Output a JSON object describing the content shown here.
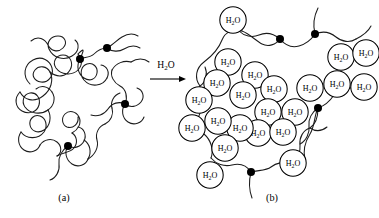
{
  "figure": {
    "background_color": "#ffffff",
    "ink_color": "#000000",
    "width": 379,
    "height": 218
  },
  "reaction": {
    "reagent_main": "H",
    "reagent_sub": "2",
    "reagent_tail": "O",
    "reagent_full": "H2O",
    "arrow_direction": "right"
  },
  "panels": [
    {
      "id": "a",
      "caption": "(a)",
      "state": "dry-collapsed-polymer-network",
      "crosslink_count": 4,
      "water_count": 0
    },
    {
      "id": "b",
      "caption": "(b)",
      "state": "swollen-hydrated-network",
      "crosslink_count": 4,
      "water_count": 22
    }
  ],
  "water_label": {
    "main": "H",
    "sub": "2",
    "tail": "O",
    "full": "H2O"
  },
  "panel_a": {
    "chains": [
      "M 30 84 C 22 76 24 65 33 60 C 42 55 50 61 52 68 C 54 76 48 83 41 82 C 34 81 31 75 35 70 C 39 65 47 66 50 72 C 54 80 51 90 43 96 C 34 103 24 100 20 92",
      "M 31 41 C 38 35 45 39 48 45 C 51 51 58 53 63 48 C 68 43 65 36 58 36 C 51 36 46 42 49 49 C 53 58 64 61 72 56 C 79 52 80 44 75 40",
      "M 50 72 C 57 78 66 77 70 70 C 74 63 70 55 63 55 C 56 55 52 62 56 68 C 61 75 72 76 78 70 C 83 65 82 58 78 54",
      "M 78 54 C 82 50 86 46 80 59",
      "M 80 59 C 84 57 90 58 94 54 C 98 50 103 48 107 48",
      "M 107 48 C 113 45 117 40 122 37 C 127 34 133 33 138 36",
      "M 107 48 C 112 52 119 52 124 49 C 129 46 135 45 140 48",
      "M 80 59 C 76 66 78 74 84 78 C 90 82 96 79 97 73 C 98 67 93 62 87 64 C 81 66 79 74 84 80 C 91 88 103 86 107 78",
      "M 107 78 C 110 72 107 66 101 65",
      "M 20 92 C 14 98 15 107 22 111 C 29 115 37 112 39 105 C 41 98 36 92 30 93 C 24 94 21 101 25 107 C 30 114 41 115 48 110",
      "M 48 110 C 54 106 56 98 52 92",
      "M 52 92 C 48 86 41 85 36 89",
      "M 48 110 C 52 117 50 126 44 130 C 38 134 31 131 30 125 C 29 119 34 114 40 116 C 46 118 48 126 44 132 C 38 140 26 139 21 132",
      "M 21 132 C 17 138 18 146 24 150 C 30 154 38 151 40 145",
      "M 40 145 C 44 139 52 138 57 142 C 62 146 62 153 57 156",
      "M 57 156 C 63 152 70 153 74 148 C 78 143 77 136 72 133",
      "M 72 133 C 78 130 82 123 79 117 C 76 111 69 110 65 114 C 61 118 62 125 67 127 C 73 129 79 124 78 117",
      "M 68 146 C 74 149 81 147 84 141 C 87 135 84 128 78 127",
      "M 68 146 C 64 152 66 160 72 164 C 78 168 86 165 88 159",
      "M 88 159 C 92 152 90 144 84 140",
      "M 68 146 C 62 150 58 157 59 164 C 60 171 56 178 50 180",
      "M 88 159 C 95 155 99 147 97 140 C 95 133 99 126 105 124",
      "M 105 124 C 111 121 114 114 112 108",
      "M 112 108 C 110 102 114 95 120 93",
      "M 125 104 C 130 108 137 107 141 102 C 145 97 143 90 137 88",
      "M 125 104 C 121 110 122 118 128 122 C 134 126 142 123 144 117",
      "M 125 104 C 128 97 126 89 120 86 C 114 83 110 76 112 70",
      "M 112 70 C 116 63 124 60 131 62",
      "M 131 62 C 137 58 144 58 149 62",
      "M 125 104 C 119 101 112 103 108 109 C 104 115 97 117 91 115"
    ],
    "crosslinks": [
      {
        "cx": 80,
        "cy": 59,
        "r": 4.0
      },
      {
        "cx": 107,
        "cy": 48,
        "r": 4.0
      },
      {
        "cx": 125,
        "cy": 104,
        "r": 4.0
      },
      {
        "cx": 68,
        "cy": 146,
        "r": 4.0
      }
    ],
    "caption_x": 64,
    "caption_y": 201
  },
  "panel_b": {
    "chains": [
      "M 200 86 C 194 78 196 68 204 62 C 212 56 219 48 222 40 C 225 32 234 28 242 31",
      "M 242 31 C 250 34 256 41 262 44 C 268 47 276 45 280 39",
      "M 280 39 C 285 45 292 48 299 46 C 306 44 311 40 315 34",
      "M 200 86 C 194 94 195 104 202 110",
      "M 202 110 C 196 118 197 128 204 134 C 211 140 214 150 211 158",
      "M 211 158 C 216 164 224 167 232 165 C 240 163 247 166 251 172",
      "M 251 172 C 258 170 266 171 271 167 C 276 163 284 161 290 164",
      "M 290 164 C 297 160 301 152 300 145 C 299 138 303 130 310 128",
      "M 310 128 C 316 124 318 117 318 108",
      "M 318 108 C 324 106 330 101 334 95 C 338 89 345 86 351 88",
      "M 318 108 C 312 112 308 119 309 126 C 310 133 306 141 300 144",
      "M 318 108 C 314 116 315 126 310 134 C 305 142 303 151 305 159",
      "M 315 34 C 313 26 314 16 318 8",
      "M 315 34 C 322 31 330 32 336 37 C 342 42 350 43 356 39",
      "M 280 39 C 274 34 266 32 259 35 C 252 38 244 36 239 31",
      "M 251 172 C 249 180 249 190 252 198",
      "M 202 110 C 208 106 212 98 210 91",
      "M 310 128 C 316 132 322 131 327 127",
      "M 200 86 C 206 82 208 74 205 67",
      "M 356 39 C 362 36 368 32 371 26"
    ],
    "crosslinks": [
      {
        "cx": 315,
        "cy": 34,
        "r": 4.0
      },
      {
        "cx": 280,
        "cy": 39,
        "r": 4.0
      },
      {
        "cx": 318,
        "cy": 108,
        "r": 4.0
      },
      {
        "cx": 251,
        "cy": 172,
        "r": 4.0
      }
    ],
    "waters": [
      {
        "cx": 233,
        "cy": 20,
        "r": 13.2
      },
      {
        "cx": 228,
        "cy": 62,
        "r": 13.2
      },
      {
        "cx": 255,
        "cy": 75,
        "r": 13.2
      },
      {
        "cx": 217,
        "cy": 83,
        "r": 13.2
      },
      {
        "cx": 243,
        "cy": 95,
        "r": 13.2
      },
      {
        "cx": 274,
        "cy": 89,
        "r": 13.2
      },
      {
        "cx": 268,
        "cy": 112,
        "r": 13.2
      },
      {
        "cx": 295,
        "cy": 112,
        "r": 13.2
      },
      {
        "cx": 310,
        "cy": 88,
        "r": 13.2
      },
      {
        "cx": 337,
        "cy": 84,
        "r": 13.2
      },
      {
        "cx": 341,
        "cy": 57,
        "r": 13.2
      },
      {
        "cx": 366,
        "cy": 53,
        "r": 13.2
      },
      {
        "cx": 364,
        "cy": 87,
        "r": 13.2
      },
      {
        "cx": 258,
        "cy": 133,
        "r": 13.2
      },
      {
        "cx": 240,
        "cy": 128,
        "r": 13.2
      },
      {
        "cx": 218,
        "cy": 121,
        "r": 13.2
      },
      {
        "cx": 192,
        "cy": 128,
        "r": 13.2
      },
      {
        "cx": 225,
        "cy": 148,
        "r": 13.2
      },
      {
        "cx": 293,
        "cy": 163,
        "r": 13.2
      },
      {
        "cx": 210,
        "cy": 175,
        "r": 13.2
      },
      {
        "cx": 283,
        "cy": 132,
        "r": 13.2
      },
      {
        "cx": 199,
        "cy": 100,
        "r": 13.2
      }
    ],
    "caption_x": 272,
    "caption_y": 201
  },
  "arrow": {
    "x1": 150,
    "x2": 186,
    "y": 79,
    "label_x": 166,
    "label_y": 68
  }
}
